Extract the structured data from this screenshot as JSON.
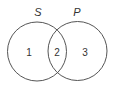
{
  "diagram": {
    "type": "venn",
    "sets": [
      {
        "name": "S",
        "label": "S"
      },
      {
        "name": "P",
        "label": "P"
      }
    ],
    "regions": [
      {
        "id": 1,
        "label": "1",
        "description": "S only"
      },
      {
        "id": 2,
        "label": "2",
        "description": "S and P"
      },
      {
        "id": 3,
        "label": "3",
        "description": "P only"
      }
    ],
    "colors": {
      "stroke": "#555555",
      "text": "#333333",
      "background": "#ffffff"
    }
  }
}
